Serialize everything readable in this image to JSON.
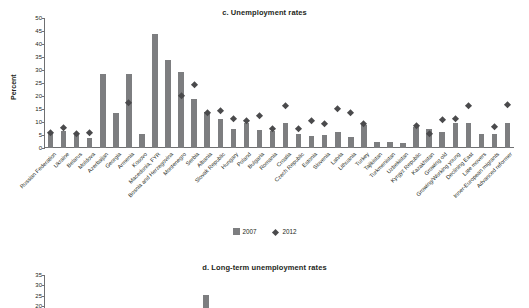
{
  "chart_data": [
    {
      "type": "bar",
      "panel": "c",
      "title": "c. Unemployment rates",
      "xlabel": "",
      "ylabel": "Percent",
      "ylim": [
        0,
        50
      ],
      "yticks": [
        0,
        5,
        10,
        15,
        20,
        25,
        30,
        35,
        40,
        45,
        50
      ],
      "grid": false,
      "legend": [
        "2007",
        "2012"
      ],
      "legend_position": "bottom-center",
      "categories": [
        "Russian Federation",
        "Ukraine",
        "Belarus",
        "Moldova",
        "Azerbaijan",
        "Georgia",
        "Armenia",
        "Kosovo",
        "Macedonia, FYR",
        "Bosnia and Herzegovina",
        "Montenegro",
        "Serbia",
        "Albania",
        "Slovak Republic",
        "Hungary",
        "Poland",
        "Bulgaria",
        "Romania",
        "Croatia",
        "Czech Republic",
        "Estonia",
        "Slovenia",
        "Latvia",
        "Lithuania",
        "Turkey",
        "Tajikistan",
        "Turkmenistan",
        "Uzbekistan",
        "Kyrgyz Republic",
        "Kazakhstan",
        "Growing old",
        "Growing/Working young",
        "Declining East",
        "Late movers",
        "Inner-European migrants",
        "Advanced reformer"
      ],
      "series": [
        {
          "name": "2007",
          "values": [
            6.0,
            6.4,
            5.0,
            4.0,
            28.5,
            13.3,
            28.4,
            5.4,
            44.0,
            34.0,
            29.3,
            19.0,
            14.0,
            11.1,
            7.4,
            9.6,
            6.9,
            6.4,
            9.6,
            5.3,
            4.7,
            4.9,
            6.0,
            4.3,
            8.9,
            2.3,
            2.3,
            1.8,
            8.2,
            7.3,
            6.0,
            9.5,
            9.6,
            5.5,
            5.5,
            9.6
          ]
        },
        {
          "name": "2012",
          "values": [
            5.5,
            7.5,
            5.3,
            5.6,
            null,
            null,
            17.3,
            null,
            null,
            null,
            19.7,
            23.9,
            13.3,
            14.0,
            11.0,
            10.1,
            12.3,
            7.0,
            15.8,
            7.0,
            10.2,
            8.9,
            15.0,
            13.3,
            9.2,
            null,
            null,
            null,
            8.4,
            5.3,
            10.5,
            10.9,
            16.0,
            null,
            8.0,
            16.5
          ]
        }
      ]
    },
    {
      "type": "bar",
      "panel": "d",
      "title": "d. Long-term unemployment rates",
      "xlabel": "",
      "ylabel": "Percent",
      "ylim": [
        0,
        35
      ],
      "yticks": [
        0,
        5,
        10,
        15,
        20,
        25,
        30,
        35
      ],
      "grid": false,
      "categories": [],
      "series": [
        {
          "name": "2007",
          "values": []
        }
      ]
    }
  ],
  "legend": {
    "item_2007": "2007",
    "item_2012": "2012"
  },
  "panel_c": {
    "title": "c. Unemployment rates",
    "ylabel": "Percent"
  },
  "panel_d": {
    "title": "d. Long-term unemployment rates",
    "ylabel": "Percent"
  }
}
